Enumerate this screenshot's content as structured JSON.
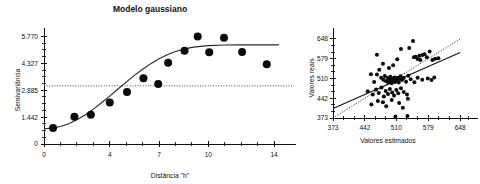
{
  "figure": {
    "panels": [
      "semivariogram",
      "predicted-vs-observed"
    ]
  },
  "chart_data": [
    {
      "id": "semivariogram",
      "type": "scatter",
      "title": "Modelo gaussiano",
      "xlabel": "Distância \"h\"",
      "ylabel": "Semivariância",
      "xlim": [
        0,
        14.6
      ],
      "ylim": [
        0,
        5.9
      ],
      "xticks": [
        0,
        4,
        7,
        10,
        14
      ],
      "xtick_labels": [
        "0",
        "4",
        "7",
        "10",
        "14"
      ],
      "yticks": [
        0,
        1.442,
        2.885,
        4.327,
        5.77
      ],
      "ytick_labels": [
        "0",
        "1.442",
        "2.885",
        "4.327",
        "5.770"
      ],
      "grid": false,
      "legend": "none",
      "annotations": [
        {
          "kind": "sill-reference-line",
          "style": "dotted",
          "y": 3.12
        }
      ],
      "points": [
        {
          "x": 0.55,
          "y": 0.86
        },
        {
          "x": 1.85,
          "y": 1.46
        },
        {
          "x": 2.85,
          "y": 1.57
        },
        {
          "x": 4.0,
          "y": 2.22
        },
        {
          "x": 5.05,
          "y": 2.79
        },
        {
          "x": 6.05,
          "y": 3.52
        },
        {
          "x": 6.95,
          "y": 3.22
        },
        {
          "x": 7.55,
          "y": 4.36
        },
        {
          "x": 8.55,
          "y": 5.0
        },
        {
          "x": 9.35,
          "y": 5.77
        },
        {
          "x": 10.05,
          "y": 4.92
        },
        {
          "x": 10.95,
          "y": 5.7
        },
        {
          "x": 12.05,
          "y": 4.93
        },
        {
          "x": 13.55,
          "y": 4.28
        }
      ],
      "model": {
        "name": "gaussiano",
        "nugget": 0.82,
        "sill": 5.25,
        "range": 8.6,
        "curve": [
          {
            "x": 0.0,
            "y": 0.82
          },
          {
            "x": 0.5,
            "y": 0.85
          },
          {
            "x": 1.0,
            "y": 0.94
          },
          {
            "x": 1.5,
            "y": 1.09
          },
          {
            "x": 2.0,
            "y": 1.3
          },
          {
            "x": 2.5,
            "y": 1.56
          },
          {
            "x": 3.0,
            "y": 1.87
          },
          {
            "x": 3.5,
            "y": 2.21
          },
          {
            "x": 4.0,
            "y": 2.57
          },
          {
            "x": 4.5,
            "y": 2.95
          },
          {
            "x": 5.0,
            "y": 3.32
          },
          {
            "x": 5.5,
            "y": 3.68
          },
          {
            "x": 6.0,
            "y": 4.01
          },
          {
            "x": 6.5,
            "y": 4.31
          },
          {
            "x": 7.0,
            "y": 4.57
          },
          {
            "x": 7.5,
            "y": 4.79
          },
          {
            "x": 8.0,
            "y": 4.96
          },
          {
            "x": 8.5,
            "y": 5.09
          },
          {
            "x": 9.0,
            "y": 5.18
          },
          {
            "x": 9.5,
            "y": 5.24
          },
          {
            "x": 10.0,
            "y": 5.28
          },
          {
            "x": 11.0,
            "y": 5.31
          },
          {
            "x": 12.0,
            "y": 5.32
          },
          {
            "x": 13.0,
            "y": 5.32
          },
          {
            "x": 14.3,
            "y": 5.32
          }
        ]
      }
    },
    {
      "id": "predicted-vs-observed",
      "type": "scatter",
      "title": "",
      "xlabel": "Valores estimados",
      "ylabel": "Valores reais",
      "xlim": [
        373,
        665
      ],
      "ylim": [
        373,
        665
      ],
      "xticks": [
        373,
        442,
        510,
        579,
        648
      ],
      "xtick_labels": [
        "373",
        "442",
        "510",
        "579",
        "648"
      ],
      "yticks": [
        373,
        442,
        510,
        579,
        648
      ],
      "ytick_labels": [
        "373",
        "442",
        "510",
        "579",
        "648"
      ],
      "grid": false,
      "legend": "none",
      "lines": [
        {
          "kind": "regression-line",
          "style": "solid",
          "x0": 373,
          "y0": 406,
          "x1": 648,
          "y1": 601
        },
        {
          "kind": "identity-line",
          "style": "dotted",
          "x0": 373,
          "y0": 373,
          "x1": 648,
          "y1": 648
        }
      ],
      "points": [
        {
          "x": 468,
          "y": 593
        },
        {
          "x": 481,
          "y": 562
        },
        {
          "x": 494,
          "y": 547
        },
        {
          "x": 503,
          "y": 556
        },
        {
          "x": 512,
          "y": 577
        },
        {
          "x": 520,
          "y": 613
        },
        {
          "x": 538,
          "y": 616
        },
        {
          "x": 546,
          "y": 641
        },
        {
          "x": 548,
          "y": 584
        },
        {
          "x": 552,
          "y": 586
        },
        {
          "x": 556,
          "y": 578
        },
        {
          "x": 560,
          "y": 589
        },
        {
          "x": 562,
          "y": 575
        },
        {
          "x": 566,
          "y": 592
        },
        {
          "x": 571,
          "y": 595
        },
        {
          "x": 576,
          "y": 584
        },
        {
          "x": 582,
          "y": 604
        },
        {
          "x": 588,
          "y": 575
        },
        {
          "x": 594,
          "y": 579
        },
        {
          "x": 601,
          "y": 581
        },
        {
          "x": 455,
          "y": 525
        },
        {
          "x": 462,
          "y": 498
        },
        {
          "x": 468,
          "y": 524
        },
        {
          "x": 473,
          "y": 541
        },
        {
          "x": 477,
          "y": 513
        },
        {
          "x": 482,
          "y": 506
        },
        {
          "x": 485,
          "y": 519
        },
        {
          "x": 488,
          "y": 501
        },
        {
          "x": 491,
          "y": 512
        },
        {
          "x": 493,
          "y": 496
        },
        {
          "x": 495,
          "y": 507
        },
        {
          "x": 497,
          "y": 516
        },
        {
          "x": 499,
          "y": 504
        },
        {
          "x": 500,
          "y": 494
        },
        {
          "x": 502,
          "y": 510
        },
        {
          "x": 504,
          "y": 502
        },
        {
          "x": 506,
          "y": 514
        },
        {
          "x": 507,
          "y": 498
        },
        {
          "x": 509,
          "y": 508
        },
        {
          "x": 511,
          "y": 503
        },
        {
          "x": 513,
          "y": 513
        },
        {
          "x": 515,
          "y": 496
        },
        {
          "x": 517,
          "y": 509
        },
        {
          "x": 519,
          "y": 518
        },
        {
          "x": 522,
          "y": 505
        },
        {
          "x": 526,
          "y": 512
        },
        {
          "x": 531,
          "y": 499
        },
        {
          "x": 536,
          "y": 520
        },
        {
          "x": 541,
          "y": 508
        },
        {
          "x": 549,
          "y": 497
        },
        {
          "x": 566,
          "y": 506
        },
        {
          "x": 578,
          "y": 510
        },
        {
          "x": 586,
          "y": 505
        },
        {
          "x": 592,
          "y": 514
        },
        {
          "x": 556,
          "y": 513
        },
        {
          "x": 448,
          "y": 466
        },
        {
          "x": 459,
          "y": 455
        },
        {
          "x": 466,
          "y": 472
        },
        {
          "x": 472,
          "y": 460
        },
        {
          "x": 478,
          "y": 479
        },
        {
          "x": 483,
          "y": 448
        },
        {
          "x": 487,
          "y": 467
        },
        {
          "x": 492,
          "y": 456
        },
        {
          "x": 496,
          "y": 474
        },
        {
          "x": 501,
          "y": 462
        },
        {
          "x": 505,
          "y": 451
        },
        {
          "x": 510,
          "y": 470
        },
        {
          "x": 514,
          "y": 459
        },
        {
          "x": 520,
          "y": 476
        },
        {
          "x": 526,
          "y": 463
        },
        {
          "x": 533,
          "y": 455
        },
        {
          "x": 456,
          "y": 420
        },
        {
          "x": 470,
          "y": 432
        },
        {
          "x": 488,
          "y": 414
        },
        {
          "x": 500,
          "y": 436
        },
        {
          "x": 516,
          "y": 425
        },
        {
          "x": 524,
          "y": 409
        },
        {
          "x": 535,
          "y": 440
        },
        {
          "x": 508,
          "y": 378
        },
        {
          "x": 534,
          "y": 380
        },
        {
          "x": 481,
          "y": 428
        }
      ]
    }
  ]
}
